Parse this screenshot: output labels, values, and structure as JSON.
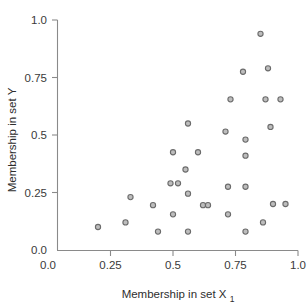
{
  "chart_data": {
    "type": "scatter",
    "title": "",
    "xlabel": "Membership in set X",
    "xlabel_subscript": "1",
    "ylabel": "Membership in set Y",
    "xlim": [
      0.0,
      1.0
    ],
    "ylim": [
      0.0,
      1.0
    ],
    "xticks": [
      "0.0",
      "0.25",
      "0.5",
      "0.75",
      "1.0"
    ],
    "xtick_values": [
      0.0,
      0.25,
      0.5,
      0.75,
      1.0
    ],
    "yticks": [
      "0.0",
      "0.25",
      "0.5",
      "0.75",
      "1.0"
    ],
    "ytick_values": [
      0.0,
      0.25,
      0.5,
      0.75,
      1.0
    ],
    "grid": false,
    "legend": "none",
    "marker": {
      "shape": "circle",
      "stroke_color": "#6b6b6b",
      "fill_color": "#bdbdbd",
      "radius": 2.6
    },
    "axis_color": "#8a8a8a",
    "n_points": 33,
    "x": [
      0.2,
      0.31,
      0.33,
      0.42,
      0.44,
      0.49,
      0.5,
      0.5,
      0.55,
      0.56,
      0.56,
      0.56,
      0.6,
      0.6,
      0.63,
      0.71,
      0.72,
      0.72,
      0.73,
      0.78,
      0.79,
      0.79,
      0.79,
      0.79,
      0.85,
      0.86,
      0.87,
      0.88,
      0.89,
      0.89,
      0.9,
      0.93,
      0.95
    ],
    "y": [
      0.1,
      0.12,
      0.23,
      0.195,
      0.08,
      0.29,
      0.425,
      0.155,
      0.35,
      0.55,
      0.245,
      0.08,
      0.425,
      0.08,
      0.195,
      0.515,
      0.275,
      0.155,
      0.655,
      0.775,
      0.48,
      0.41,
      0.275,
      0.08,
      0.94,
      0.12,
      0.655,
      0.79,
      0.535,
      0.2,
      0.1,
      0.655,
      0.2
    ],
    "points": [
      {
        "x": 0.2,
        "y": 0.1
      },
      {
        "x": 0.31,
        "y": 0.12
      },
      {
        "x": 0.33,
        "y": 0.23
      },
      {
        "x": 0.42,
        "y": 0.195
      },
      {
        "x": 0.44,
        "y": 0.08
      },
      {
        "x": 0.49,
        "y": 0.29
      },
      {
        "x": 0.5,
        "y": 0.425
      },
      {
        "x": 0.5,
        "y": 0.155
      },
      {
        "x": 0.55,
        "y": 0.35
      },
      {
        "x": 0.56,
        "y": 0.55
      },
      {
        "x": 0.56,
        "y": 0.245
      },
      {
        "x": 0.56,
        "y": 0.08
      },
      {
        "x": 0.6,
        "y": 0.425
      },
      {
        "x": 0.62,
        "y": 0.195
      },
      {
        "x": 0.71,
        "y": 0.515
      },
      {
        "x": 0.72,
        "y": 0.275
      },
      {
        "x": 0.72,
        "y": 0.155
      },
      {
        "x": 0.73,
        "y": 0.655
      },
      {
        "x": 0.78,
        "y": 0.775
      },
      {
        "x": 0.79,
        "y": 0.48
      },
      {
        "x": 0.79,
        "y": 0.41
      },
      {
        "x": 0.79,
        "y": 0.275
      },
      {
        "x": 0.79,
        "y": 0.08
      },
      {
        "x": 0.85,
        "y": 0.94
      },
      {
        "x": 0.86,
        "y": 0.12
      },
      {
        "x": 0.87,
        "y": 0.655
      },
      {
        "x": 0.88,
        "y": 0.79
      },
      {
        "x": 0.89,
        "y": 0.535
      },
      {
        "x": 0.9,
        "y": 0.2
      },
      {
        "x": 0.93,
        "y": 0.655
      },
      {
        "x": 0.95,
        "y": 0.2
      },
      {
        "x": 0.64,
        "y": 0.195
      },
      {
        "x": 0.52,
        "y": 0.29
      }
    ]
  }
}
